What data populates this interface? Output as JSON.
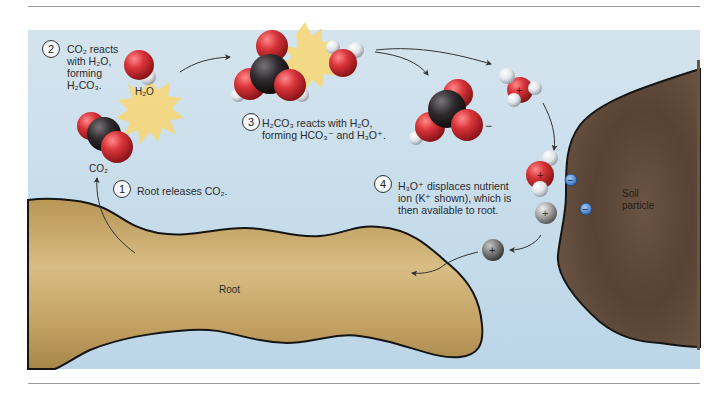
{
  "figure": {
    "steps": [
      {
        "number": "1",
        "text": "Root releases CO₂."
      },
      {
        "number": "2",
        "lines": [
          "CO₂ reacts",
          "with H₂O,",
          "forming",
          "H₂CO₃."
        ]
      },
      {
        "number": "3",
        "lines": [
          "H₂CO₃ reacts with H₂O,",
          "forming HCO₃⁻ and H₃O⁺."
        ]
      },
      {
        "number": "4",
        "lines": [
          "H₃O⁺ displaces nutrient",
          "ion (K⁺ shown), which is",
          "then available to root."
        ]
      }
    ],
    "labels": {
      "water": "H₂O",
      "co2": "CO₂",
      "root": "Root",
      "soil_line1": "Soil",
      "soil_line2": "particle",
      "plus": "+",
      "minus": "−"
    },
    "colors": {
      "water_bg": "#c6dcea",
      "root": "#c9a96a",
      "soil": "#5e4838",
      "oxygen": "#d9343a",
      "carbon": "#2e2a2d",
      "hydrogen": "#dfe3e8",
      "burst": "#f6d77a",
      "negative_charge": "#5b8fd1",
      "potassium": "#9c9c9c"
    }
  }
}
